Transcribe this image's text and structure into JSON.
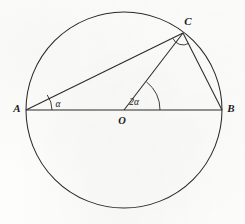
{
  "figure": {
    "kind": "geometry-diagram",
    "stroke_color": "#2a2a2a",
    "background_color": "#fdfdfb",
    "circle": {
      "center_x": 124,
      "center_y": 110,
      "radius": 98
    },
    "points": [
      {
        "id": "A",
        "label": "A",
        "x": 26,
        "y": 110,
        "label_x": 17,
        "label_y": 112
      },
      {
        "id": "B",
        "label": "B",
        "x": 222,
        "y": 110,
        "label_x": 229,
        "label_y": 112
      },
      {
        "id": "C",
        "label": "C",
        "x": 183,
        "y": 33,
        "label_x": 187,
        "label_y": 25
      },
      {
        "id": "O",
        "label": "O",
        "x": 124,
        "y": 110,
        "label_x": 121,
        "label_y": 123
      }
    ],
    "segments": [
      {
        "id": "AB",
        "from": "A",
        "to": "B",
        "name": "diameter-ab"
      },
      {
        "id": "AC",
        "from": "A",
        "to": "C",
        "name": "chord-ac"
      },
      {
        "id": "OC",
        "from": "O",
        "to": "C",
        "name": "radius-oc"
      },
      {
        "id": "CB",
        "from": "C",
        "to": "B",
        "name": "chord-cb"
      }
    ],
    "angles": [
      {
        "id": "alpha-at-A",
        "label": "α",
        "vertex": "A",
        "radius": 26,
        "label_x": 58,
        "label_y": 106
      },
      {
        "id": "two-alpha-at-O",
        "label": "2α",
        "vertex": "O",
        "radius": 36,
        "label_x": 132,
        "label_y": 105
      },
      {
        "id": "right-angle-at-C",
        "label": "",
        "vertex": "C",
        "radius": 11,
        "label_x": 0,
        "label_y": 0
      }
    ]
  }
}
